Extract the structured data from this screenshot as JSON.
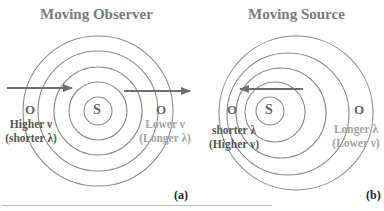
{
  "panels": [
    {
      "title": "Moving Observer",
      "tag": "(a)",
      "source_label": "S",
      "observer_labels": [
        "O",
        "O"
      ],
      "left_text": [
        "Higher ν",
        "(shorter λ)"
      ],
      "right_text": [
        "Lower ν",
        "(Longer λ)"
      ]
    },
    {
      "title": "Moving Source",
      "tag": "(b)",
      "source_label": "S",
      "observer_labels": [
        "O",
        "O"
      ],
      "left_text": [
        "shorter λ",
        "(Higher ν)"
      ],
      "right_text": [
        "Longer λ",
        "(Lower ν)"
      ]
    }
  ],
  "colors": {
    "lines": "#808080",
    "arrow": "#6e6e6e",
    "dark_text": "#555555",
    "light_text": "#a3a3a3"
  }
}
